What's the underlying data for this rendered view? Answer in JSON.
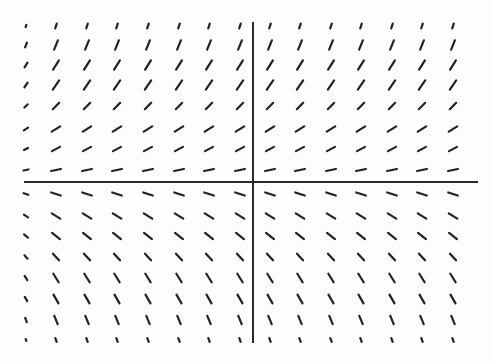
{
  "chart_data": {
    "type": "slope_field",
    "title": "",
    "xlabel": "",
    "ylabel": "",
    "grid": false,
    "legend": null,
    "axes": {
      "x_axis": {
        "y_px": 182,
        "x_start_px": 24,
        "x_end_px": 478
      },
      "y_axis": {
        "x_px": 253,
        "y_start_px": 22,
        "y_end_px": 343
      },
      "color": "#2a2a2a"
    },
    "columns_px": [
      26,
      56,
      87,
      117,
      148,
      179,
      209,
      240,
      270,
      300,
      331,
      361,
      392,
      422,
      453
    ],
    "rows": [
      {
        "y_px": 26,
        "angle_deg": 72,
        "length": 5
      },
      {
        "y_px": 45,
        "angle_deg": 68,
        "length": 10
      },
      {
        "y_px": 65,
        "angle_deg": 58,
        "length": 11
      },
      {
        "y_px": 85,
        "angle_deg": 55,
        "length": 11
      },
      {
        "y_px": 106,
        "angle_deg": 45,
        "length": 9
      },
      {
        "y_px": 129,
        "angle_deg": 32,
        "length": 10
      },
      {
        "y_px": 149,
        "angle_deg": 28,
        "length": 9
      },
      {
        "y_px": 170,
        "angle_deg": 12,
        "length": 10
      },
      {
        "y_px": 194,
        "angle_deg": -18,
        "length": 10
      },
      {
        "y_px": 216,
        "angle_deg": -32,
        "length": 10
      },
      {
        "y_px": 236,
        "angle_deg": -38,
        "length": 10
      },
      {
        "y_px": 257,
        "angle_deg": -48,
        "length": 9
      },
      {
        "y_px": 278,
        "angle_deg": -58,
        "length": 10
      },
      {
        "y_px": 299,
        "angle_deg": -60,
        "length": 10
      },
      {
        "y_px": 320,
        "angle_deg": -68,
        "length": 9
      },
      {
        "y_px": 340,
        "angle_deg": -70,
        "length": 4
      }
    ],
    "first_column_length_scale": 0.5,
    "segment_color": "#222222"
  }
}
